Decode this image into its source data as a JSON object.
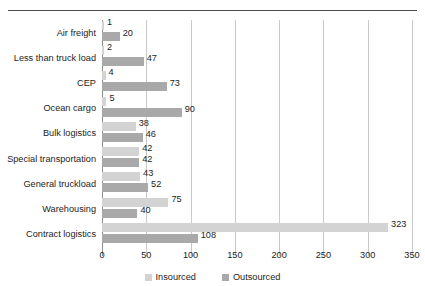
{
  "chart_data": {
    "type": "bar",
    "orientation": "horizontal",
    "title": "",
    "subtitle": "",
    "xlabel": "",
    "ylabel": "",
    "xlim": [
      0,
      350
    ],
    "xticks": [
      0,
      50,
      100,
      150,
      200,
      250,
      300,
      350
    ],
    "grid": "vertical",
    "legend_position": "bottom-center",
    "categories": [
      "Air freight",
      "Less than truck load",
      "CEP",
      "Ocean cargo",
      "Bulk logistics",
      "Special transportation",
      "General truckload",
      "Warehousing",
      "Contract logistics"
    ],
    "series": [
      {
        "name": "Insourced",
        "color": "#d3d3d3",
        "values": [
          1,
          2,
          4,
          5,
          38,
          42,
          43,
          75,
          323
        ]
      },
      {
        "name": "Outsourced",
        "color": "#a9a9a9",
        "values": [
          20,
          47,
          73,
          90,
          46,
          42,
          52,
          40,
          108
        ]
      }
    ]
  },
  "legend": {
    "items": [
      {
        "label": "Insourced",
        "swatch": "insourced-swatch"
      },
      {
        "label": "Outsourced",
        "swatch": "outsourced-swatch"
      }
    ]
  }
}
